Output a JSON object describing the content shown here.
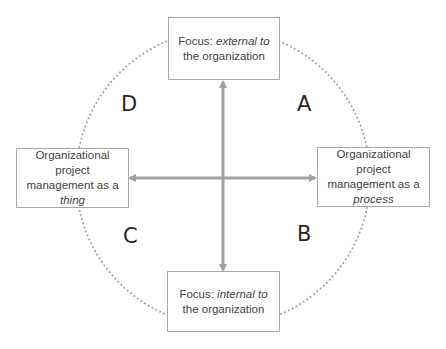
{
  "diagram": {
    "type": "quadrant-framework",
    "colors": {
      "box_border": "#a9a9a9",
      "text": "#3f3f3f",
      "arrow": "#a0a0a0",
      "circle": "#a0a0a0",
      "quadrant_label": "#262626"
    },
    "boxes": {
      "top": {
        "prefix": "Focus: ",
        "emph": "external to",
        "suffix": "the organization"
      },
      "bottom": {
        "prefix": "Focus: ",
        "emph": "internal to",
        "suffix": "the organization"
      },
      "left": {
        "line1": "Organizational",
        "line2": "project",
        "line3": "management as a",
        "emph": "thing"
      },
      "right": {
        "line1": "Organizational",
        "line2": "project",
        "line3": "management as a",
        "emph": "process"
      }
    },
    "quadrants": {
      "top_right": "A",
      "bottom_right": "B",
      "bottom_left": "C",
      "top_left": "D"
    }
  }
}
